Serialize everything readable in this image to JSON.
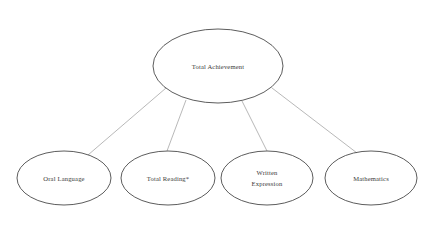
{
  "diagram": {
    "type": "hierarchy",
    "title_node": {
      "id": "total-achievement",
      "label": "Total Achievement",
      "cx": 218,
      "cy": 66,
      "rx": 65,
      "ry": 37
    },
    "child_nodes": [
      {
        "id": "oral-language",
        "label": "Oral Language",
        "lines": [
          "Oral Language"
        ],
        "cx": 64,
        "cy": 178,
        "rx": 47,
        "ry": 27
      },
      {
        "id": "total-reading",
        "label": "Total Reading*",
        "lines": [
          "Total Reading*"
        ],
        "footnote_marker": "*",
        "cx": 168,
        "cy": 178,
        "rx": 47,
        "ry": 27
      },
      {
        "id": "written-expression",
        "label": "Written Expression",
        "lines": [
          "Written",
          "Expression"
        ],
        "cx": 267,
        "cy": 178,
        "rx": 46,
        "ry": 27
      },
      {
        "id": "mathematics",
        "label": "Mathematics",
        "lines": [
          "Mathematics"
        ],
        "cx": 371,
        "cy": 178,
        "rx": 46,
        "ry": 27
      }
    ],
    "connectors": [
      {
        "id": "link-total-achievement-oral-language",
        "from": "total-achievement",
        "to": "oral-language",
        "x1": 166,
        "y1": 88,
        "x2": 88,
        "y2": 155
      },
      {
        "id": "link-total-achievement-total-reading",
        "from": "total-achievement",
        "to": "total-reading",
        "x1": 186,
        "y1": 100,
        "x2": 167,
        "y2": 151
      },
      {
        "id": "link-total-achievement-written-expression",
        "from": "total-achievement",
        "to": "written-expression",
        "x1": 242,
        "y1": 101,
        "x2": 267,
        "y2": 151
      },
      {
        "id": "link-total-achievement-mathematics",
        "from": "total-achievement",
        "to": "mathematics",
        "x1": 272,
        "y1": 88,
        "x2": 357,
        "y2": 153
      }
    ],
    "colors": {
      "node_stroke": "#4a4a4a",
      "connector_stroke": "#9a9a9a",
      "text": "#3a3a3a",
      "background": "#ffffff"
    }
  }
}
